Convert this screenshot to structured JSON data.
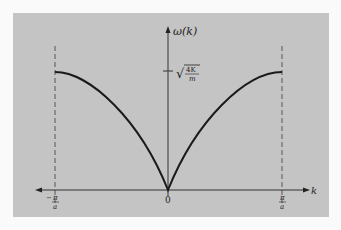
{
  "figure": {
    "y_axis_label": "ω(k)",
    "x_axis_label": "k",
    "origin_label": "0",
    "max_label": {
      "radical": "√",
      "numerator": "4K",
      "denominator": "m"
    },
    "left_bound": {
      "sign": "−",
      "numerator": "π",
      "denominator": "a"
    },
    "right_bound": {
      "numerator": "π",
      "denominator": "a"
    },
    "colors": {
      "background": "#c4c4c4",
      "curve": "#1a1a1a",
      "axis": "#333333",
      "dashed": "#555555"
    },
    "curve_description": "ω(k) = sqrt(4K/m) |sin(ka/2)| over first Brillouin zone"
  }
}
